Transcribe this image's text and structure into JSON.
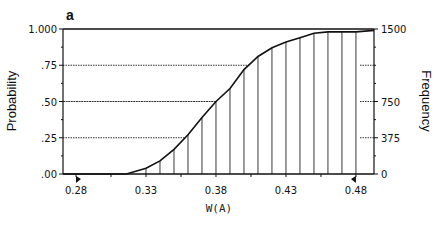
{
  "chart_data": {
    "type": "line",
    "panel_label": "a",
    "title": "",
    "xlabel": "W(A)",
    "ylabel": "Probability",
    "y2label": "Frequency",
    "xlim": [
      0.2707,
      0.4929
    ],
    "ylim": [
      0,
      1
    ],
    "y2lim": [
      0,
      1500
    ],
    "x_ticks": [
      0.28,
      0.33,
      0.38,
      0.43,
      0.48
    ],
    "x_tick_labels": [
      "0.28",
      "0.33",
      "0.38",
      "0.43",
      "0.48"
    ],
    "x_minor_ticks": [
      0.305,
      0.355,
      0.405,
      0.455
    ],
    "y_ticks": [
      0,
      0.25,
      0.5,
      0.75,
      1.0
    ],
    "y_tick_labels": [
      ".00",
      ".25",
      ".50",
      ".75",
      "1.000"
    ],
    "y_minor_ticks": [
      0.125,
      0.375,
      0.625,
      0.875
    ],
    "y2_ticks": [
      0,
      375,
      750,
      1500
    ],
    "y2_tick_labels": [
      "0",
      "375",
      "750",
      "1500"
    ],
    "y2_minor_ticks": [
      187.5,
      562.5,
      937.5,
      1125,
      1312.5
    ],
    "reference_lines": [
      0.25,
      0.5,
      0.75
    ],
    "markers": [
      0.28,
      0.48
    ],
    "grid": false,
    "series": [
      {
        "name": "cumulative probability",
        "x": [
          0.2707,
          0.316,
          0.33,
          0.34,
          0.35,
          0.36,
          0.37,
          0.38,
          0.39,
          0.4,
          0.41,
          0.42,
          0.43,
          0.44,
          0.45,
          0.46,
          0.47,
          0.48,
          0.4929
        ],
        "y": [
          0,
          0,
          0.04,
          0.09,
          0.17,
          0.27,
          0.39,
          0.5,
          0.59,
          0.72,
          0.81,
          0.87,
          0.91,
          0.94,
          0.97,
          0.98,
          0.98,
          0.98,
          0.99
        ]
      }
    ],
    "drop_lines_x": [
      0.33,
      0.34,
      0.35,
      0.36,
      0.37,
      0.38,
      0.39,
      0.4,
      0.41,
      0.42,
      0.43,
      0.44,
      0.45,
      0.46,
      0.47,
      0.48
    ]
  }
}
